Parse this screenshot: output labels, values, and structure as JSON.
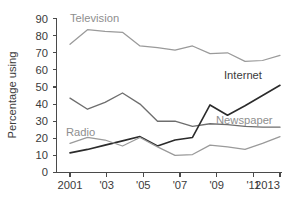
{
  "chart_data": {
    "type": "line",
    "title": "",
    "subtitle": "",
    "xlabel": "",
    "ylabel": "Percentage using",
    "xlim": [
      2001,
      2013
    ],
    "ylim": [
      0,
      90
    ],
    "grid": false,
    "legend_position": "inline-labels",
    "x": [
      2001,
      2002,
      2003,
      2004,
      2005,
      2006,
      2007,
      2008,
      2009,
      2010,
      2011,
      2012,
      2013
    ],
    "x_tick_values": [
      2001,
      2003,
      2005,
      2007,
      2009,
      2011,
      2013
    ],
    "x_tick_labels": [
      "2001",
      "'03",
      "'05",
      "'07",
      "'09",
      "'11",
      "2013"
    ],
    "y_tick_values": [
      0,
      10,
      20,
      30,
      40,
      50,
      60,
      70,
      80,
      90
    ],
    "y_tick_labels": [
      "0",
      "10",
      "20",
      "30",
      "40",
      "50",
      "60",
      "70",
      "80",
      "90"
    ],
    "series": [
      {
        "name": "Television",
        "label": "Television",
        "color": "#9a9a9a",
        "values": [
          75,
          83.5,
          82.5,
          82,
          74,
          73,
          71.5,
          74,
          69.5,
          70,
          65,
          65.5,
          68.5
        ]
      },
      {
        "name": "Newspaper",
        "label": "Newspaper",
        "color": "#6e6e6e",
        "values": [
          43.5,
          37,
          41,
          46.5,
          40,
          30,
          30,
          27,
          28.5,
          28,
          27,
          26.5,
          26.5
        ]
      },
      {
        "name": "Internet",
        "label": "Internet",
        "color": "#2b2b2b",
        "values": [
          11.5,
          13.5,
          16,
          18.5,
          21,
          15.5,
          19,
          20.5,
          39.5,
          33.5,
          39,
          45,
          51
        ]
      },
      {
        "name": "Radio",
        "label": "Radio",
        "color": "#9a9a9a",
        "values": [
          17,
          20.5,
          19,
          15.5,
          20.5,
          15,
          10,
          10.5,
          16,
          15,
          13.5,
          17,
          21
        ]
      }
    ],
    "annotations": [
      {
        "text": "Television",
        "series": "Television",
        "x": 2002,
        "y": 90
      },
      {
        "text": "Internet",
        "series": "Internet",
        "x": 2011.3,
        "y": 54
      },
      {
        "text": "Newspaper",
        "series": "Newspaper",
        "x": 2011.2,
        "y": 32
      },
      {
        "text": "Radio",
        "series": "Radio",
        "x": 2001.9,
        "y": 25
      }
    ]
  }
}
